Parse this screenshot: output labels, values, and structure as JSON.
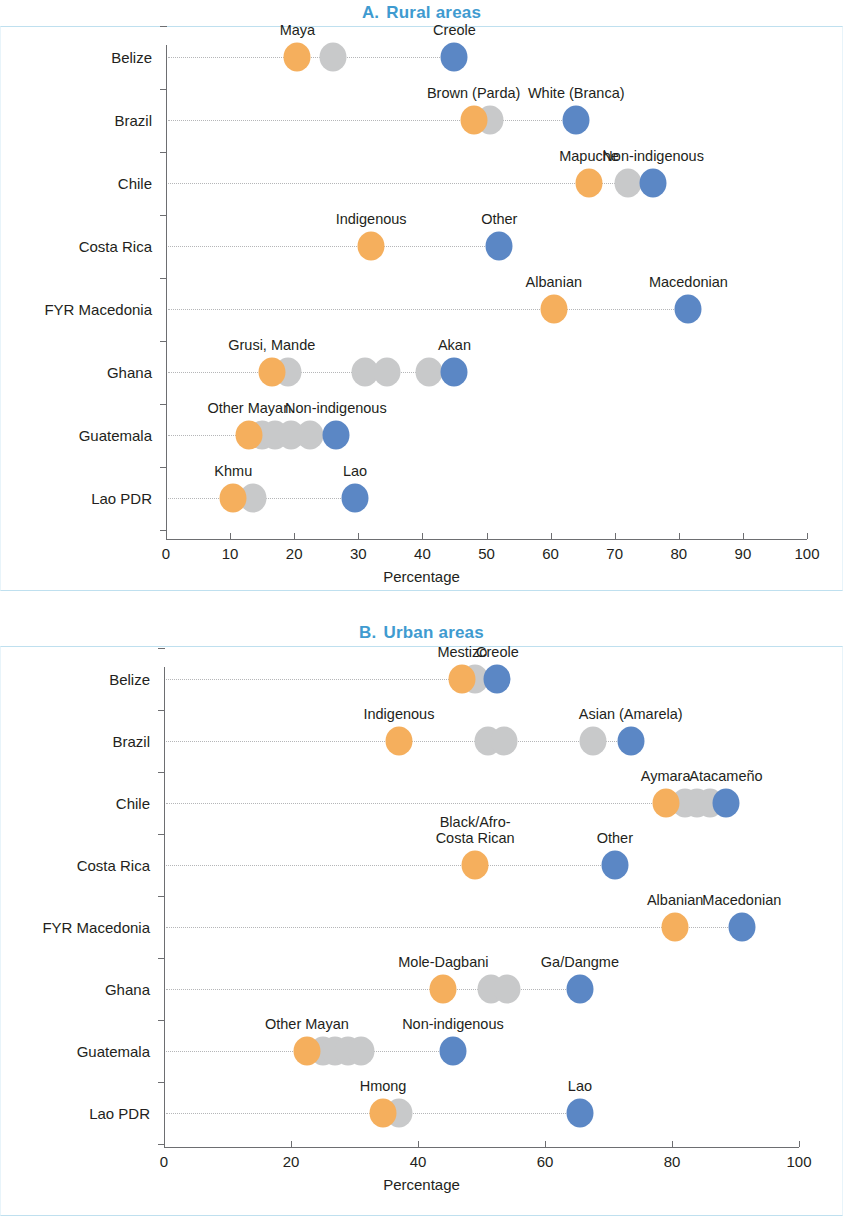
{
  "figure": {
    "panels": [
      {
        "letter": "A.",
        "title": "Rural areas"
      },
      {
        "letter": "B.",
        "title": "Urban areas"
      }
    ]
  },
  "chart_data": [
    {
      "type": "scatter",
      "panel": "A",
      "title": "A.  Rural areas",
      "xlabel": "Percentage",
      "ylabel": "",
      "xlim": [
        0,
        100
      ],
      "xticks": [
        0,
        10,
        20,
        30,
        40,
        50,
        60,
        70,
        80,
        90,
        100
      ],
      "xtick_labels": [
        "0",
        "10",
        "20",
        "30",
        "40",
        "50",
        "60",
        "70",
        "80",
        "90",
        "100"
      ],
      "categories": [
        "Belize",
        "Brazil",
        "Chile",
        "Costa Rica",
        "FYR Macedonia",
        "Ghana",
        "Guatemala",
        "Lao PDR"
      ],
      "grid": "row-guides",
      "legend": "none",
      "colors": {
        "orange": "#f5af5d",
        "gray": "#c8c9ca",
        "blue": "#5b87c5"
      },
      "rows": [
        {
          "category": "Belize",
          "points": [
            {
              "value": 20.5,
              "color": "orange",
              "label": "Maya"
            },
            {
              "value": 26.0,
              "color": "gray",
              "label": ""
            },
            {
              "value": 45.0,
              "color": "blue",
              "label": "Creole"
            }
          ]
        },
        {
          "category": "Brazil",
          "points": [
            {
              "value": 48.0,
              "color": "orange",
              "label": "Brown (Parda)"
            },
            {
              "value": 50.5,
              "color": "gray",
              "label": ""
            },
            {
              "value": 64.0,
              "color": "blue",
              "label": "White (Branca)"
            }
          ]
        },
        {
          "category": "Chile",
          "points": [
            {
              "value": 66.0,
              "color": "orange",
              "label": "Mapuche"
            },
            {
              "value": 72.0,
              "color": "gray",
              "label": ""
            },
            {
              "value": 76.0,
              "color": "blue",
              "label": "Non-indigenous"
            }
          ]
        },
        {
          "category": "Costa Rica",
          "points": [
            {
              "value": 32.0,
              "color": "orange",
              "label": "Indigenous"
            },
            {
              "value": 52.0,
              "color": "blue",
              "label": "Other"
            }
          ]
        },
        {
          "category": "FYR Macedonia",
          "points": [
            {
              "value": 60.5,
              "color": "orange",
              "label": "Albanian"
            },
            {
              "value": 81.5,
              "color": "blue",
              "label": "Macedonian"
            }
          ]
        },
        {
          "category": "Ghana",
          "points": [
            {
              "value": 16.5,
              "color": "orange",
              "label": "Grusi, Mande"
            },
            {
              "value": 19.0,
              "color": "gray",
              "label": ""
            },
            {
              "value": 31.0,
              "color": "gray",
              "label": ""
            },
            {
              "value": 34.5,
              "color": "gray",
              "label": ""
            },
            {
              "value": 41.0,
              "color": "gray",
              "label": ""
            },
            {
              "value": 45.0,
              "color": "blue",
              "label": "Akan"
            }
          ]
        },
        {
          "category": "Guatemala",
          "points": [
            {
              "value": 13.0,
              "color": "orange",
              "label": "Other Mayan"
            },
            {
              "value": 15.0,
              "color": "gray",
              "label": ""
            },
            {
              "value": 17.0,
              "color": "gray",
              "label": ""
            },
            {
              "value": 19.5,
              "color": "gray",
              "label": ""
            },
            {
              "value": 22.5,
              "color": "gray",
              "label": ""
            },
            {
              "value": 26.5,
              "color": "blue",
              "label": "Non-indigenous"
            }
          ]
        },
        {
          "category": "Lao PDR",
          "points": [
            {
              "value": 10.5,
              "color": "orange",
              "label": "Khmu"
            },
            {
              "value": 13.5,
              "color": "gray",
              "label": ""
            },
            {
              "value": 29.5,
              "color": "blue",
              "label": "Lao"
            }
          ]
        }
      ]
    },
    {
      "type": "scatter",
      "panel": "B",
      "title": "B.  Urban areas",
      "xlabel": "Percentage",
      "ylabel": "",
      "xlim": [
        0,
        100
      ],
      "xticks": [
        0,
        20,
        40,
        60,
        80,
        100
      ],
      "xtick_labels": [
        "0",
        "20",
        "40",
        "60",
        "80",
        "100"
      ],
      "categories": [
        "Belize",
        "Brazil",
        "Chile",
        "Costa Rica",
        "FYR Macedonia",
        "Ghana",
        "Guatemala",
        "Lao PDR"
      ],
      "grid": "row-guides",
      "legend": "none",
      "colors": {
        "orange": "#f5af5d",
        "gray": "#c8c9ca",
        "blue": "#5b87c5"
      },
      "rows": [
        {
          "category": "Belize",
          "points": [
            {
              "value": 47.0,
              "color": "orange",
              "label": "Mestizo"
            },
            {
              "value": 49.0,
              "color": "gray",
              "label": ""
            },
            {
              "value": 52.5,
              "color": "blue",
              "label": "Creole"
            }
          ]
        },
        {
          "category": "Brazil",
          "points": [
            {
              "value": 37.0,
              "color": "orange",
              "label": "Indigenous"
            },
            {
              "value": 51.0,
              "color": "gray",
              "label": ""
            },
            {
              "value": 53.5,
              "color": "gray",
              "label": ""
            },
            {
              "value": 67.5,
              "color": "gray",
              "label": ""
            },
            {
              "value": 73.5,
              "color": "blue",
              "label": "Asian (Amarela)"
            }
          ]
        },
        {
          "category": "Chile",
          "points": [
            {
              "value": 79.0,
              "color": "orange",
              "label": "Aymara"
            },
            {
              "value": 82.0,
              "color": "gray",
              "label": ""
            },
            {
              "value": 84.0,
              "color": "gray",
              "label": ""
            },
            {
              "value": 86.0,
              "color": "gray",
              "label": ""
            },
            {
              "value": 88.5,
              "color": "blue",
              "label": "Atacameño"
            }
          ]
        },
        {
          "category": "Costa Rica",
          "points": [
            {
              "value": 49.0,
              "color": "orange",
              "label": "Black/Afro-\nCosta Rican"
            },
            {
              "value": 71.0,
              "color": "blue",
              "label": "Other"
            }
          ]
        },
        {
          "category": "FYR Macedonia",
          "points": [
            {
              "value": 80.5,
              "color": "orange",
              "label": "Albanian"
            },
            {
              "value": 91.0,
              "color": "blue",
              "label": "Macedonian"
            }
          ]
        },
        {
          "category": "Ghana",
          "points": [
            {
              "value": 44.0,
              "color": "orange",
              "label": "Mole-Dagbani"
            },
            {
              "value": 51.5,
              "color": "gray",
              "label": ""
            },
            {
              "value": 54.0,
              "color": "gray",
              "label": ""
            },
            {
              "value": 65.5,
              "color": "blue",
              "label": "Ga/Dangme"
            }
          ]
        },
        {
          "category": "Guatemala",
          "points": [
            {
              "value": 22.5,
              "color": "orange",
              "label": "Other Mayan"
            },
            {
              "value": 25.0,
              "color": "gray",
              "label": ""
            },
            {
              "value": 27.0,
              "color": "gray",
              "label": ""
            },
            {
              "value": 29.0,
              "color": "gray",
              "label": ""
            },
            {
              "value": 31.0,
              "color": "gray",
              "label": ""
            },
            {
              "value": 45.5,
              "color": "blue",
              "label": "Non-indigenous"
            }
          ]
        },
        {
          "category": "Lao PDR",
          "points": [
            {
              "value": 34.5,
              "color": "orange",
              "label": "Hmong"
            },
            {
              "value": 37.0,
              "color": "gray",
              "label": ""
            },
            {
              "value": 65.5,
              "color": "blue",
              "label": "Lao"
            }
          ]
        }
      ]
    }
  ]
}
